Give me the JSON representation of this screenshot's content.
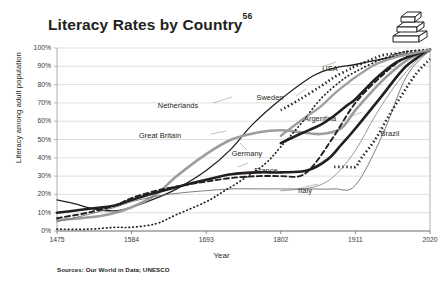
{
  "chart_data": {
    "type": "line",
    "title": "Literacy Rates by Country",
    "title_superscript": "56",
    "xlabel": "Year",
    "ylabel": "Literacy among adult population",
    "xlim": [
      1475,
      2020
    ],
    "ylim": [
      0,
      100
    ],
    "grid": true,
    "legend_position": "inline-labels",
    "source_note": "Sources: Our World in Data; UNESCO",
    "xticks": [
      "1475",
      "1584",
      "1693",
      "1802",
      "1911",
      "2020"
    ],
    "xtick_values": [
      1475,
      1584,
      1693,
      1802,
      1911,
      2020
    ],
    "yticks": [
      "0%",
      "10%",
      "20%",
      "30%",
      "40%",
      "50%",
      "60%",
      "70%",
      "80%",
      "90%",
      "100%"
    ],
    "ytick_values": [
      0,
      10,
      20,
      30,
      40,
      50,
      60,
      70,
      80,
      90,
      100
    ],
    "series": [
      {
        "name": "Netherlands",
        "style": "solid",
        "color": "#231f20",
        "width": 1.3,
        "x": [
          1475,
          1500,
          1530,
          1560,
          1584,
          1620,
          1650,
          1693,
          1730,
          1760,
          1802,
          1850,
          1880,
          1911,
          1950,
          1990,
          2020
        ],
        "values": [
          17,
          15,
          12,
          11,
          13,
          18,
          23,
          33,
          45,
          58,
          72,
          85,
          89,
          91,
          94,
          97,
          99
        ]
      },
      {
        "name": "Great Britain",
        "style": "solid",
        "color": "#9d9d9d",
        "width": 2.6,
        "x": [
          1475,
          1510,
          1550,
          1584,
          1620,
          1650,
          1693,
          1730,
          1770,
          1802,
          1830,
          1860,
          1890,
          1911,
          1950,
          1985,
          2020
        ],
        "values": [
          6,
          7,
          9,
          13,
          20,
          30,
          42,
          50,
          54,
          55,
          54,
          53,
          56,
          66,
          82,
          93,
          99
        ]
      },
      {
        "name": "Germany",
        "style": "solid",
        "color": "#231f20",
        "width": 2.6,
        "x": [
          1475,
          1520,
          1560,
          1584,
          1620,
          1660,
          1693,
          1730,
          1770,
          1802,
          1840,
          1870,
          1890,
          1911,
          1950,
          1985,
          2020
        ],
        "values": [
          10,
          12,
          14,
          17,
          21,
          25,
          28,
          31,
          32,
          32,
          33,
          39,
          47,
          56,
          74,
          90,
          99
        ]
      },
      {
        "name": "France",
        "style": "dashed",
        "color": "#231f20",
        "width": 1.9,
        "x": [
          1475,
          1520,
          1560,
          1584,
          1620,
          1660,
          1693,
          1730,
          1770,
          1802,
          1830,
          1850,
          1880,
          1911,
          1950,
          1985,
          2020
        ],
        "values": [
          7,
          10,
          14,
          18,
          22,
          25,
          27,
          29,
          30,
          30,
          30,
          36,
          52,
          70,
          85,
          95,
          99
        ]
      },
      {
        "name": "Italy",
        "style": "solid",
        "color": "#6e6e6e",
        "width": 0.9,
        "x": [
          1475,
          1520,
          1560,
          1584,
          1620,
          1660,
          1693,
          1730,
          1770,
          1802,
          1840,
          1880,
          1911,
          1950,
          1985,
          2020
        ],
        "values": [
          5,
          9,
          13,
          16,
          19,
          21,
          22,
          23,
          23,
          23,
          23,
          23,
          25,
          52,
          84,
          99
        ]
      },
      {
        "name": "Sweden",
        "style": "dotted-fine",
        "color": "#231f20",
        "width": 1.7,
        "x": [
          1475,
          1520,
          1560,
          1584,
          1620,
          1650,
          1693,
          1720,
          1750,
          1780,
          1802,
          1830,
          1860,
          1890,
          1911,
          1950,
          1985,
          2020
        ],
        "values": [
          1,
          1,
          2,
          2,
          4,
          9,
          16,
          22,
          29,
          37,
          46,
          58,
          72,
          82,
          87,
          94,
          98,
          99
        ]
      },
      {
        "name": "USA",
        "style": "dotted-coarse",
        "color": "#231f20",
        "width": 2.6,
        "x": [
          1802,
          1830,
          1860,
          1880,
          1900,
          1911,
          1930,
          1950,
          1970,
          1990,
          2020
        ],
        "values": [
          66,
          72,
          79,
          84,
          88,
          90,
          93,
          96,
          97,
          98,
          99
        ]
      },
      {
        "name": "Argentina",
        "style": "solid",
        "color": "#231f20",
        "width": 2.6,
        "x": [
          1802,
          1830,
          1860,
          1880,
          1900,
          1911,
          1940,
          1970,
          1995,
          2020
        ],
        "values": [
          48,
          53,
          58,
          63,
          69,
          72,
          83,
          92,
          96,
          99
        ]
      },
      {
        "name": "Argentina-grey",
        "style": "solid",
        "color": "#9d9d9d",
        "width": 2.3,
        "x": [
          1802,
          1830,
          1860,
          1880,
          1900,
          1911,
          1940,
          1970,
          1995,
          2020
        ],
        "values": [
          52,
          60,
          68,
          75,
          81,
          84,
          91,
          95,
          97,
          99
        ]
      },
      {
        "name": "Brazil",
        "style": "dotted-coarse",
        "color": "#231f20",
        "width": 2.6,
        "x": [
          1880,
          1900,
          1911,
          1920,
          1940,
          1960,
          1980,
          2000,
          2020
        ],
        "values": [
          35,
          35,
          35,
          40,
          50,
          63,
          75,
          86,
          94
        ]
      },
      {
        "name": "Brazil-thin",
        "style": "solid",
        "color": "#8c8c8c",
        "width": 0.9,
        "x": [
          1802,
          1850,
          1880,
          1911,
          1940,
          1970,
          2000,
          2020
        ],
        "values": [
          22,
          24,
          30,
          44,
          63,
          80,
          93,
          99
        ]
      }
    ],
    "inline_labels": [
      {
        "name": "Netherlands",
        "x_px": 178,
        "y_px": 105
      },
      {
        "name": "Great Britain",
        "x_px": 160,
        "y_px": 135
      },
      {
        "name": "Germany",
        "x_px": 247,
        "y_px": 153
      },
      {
        "name": "France",
        "x_px": 266,
        "y_px": 170
      },
      {
        "name": "Italy",
        "x_px": 305,
        "y_px": 190
      },
      {
        "name": "Sweden",
        "x_px": 270,
        "y_px": 97
      },
      {
        "name": "USA",
        "x_px": 330,
        "y_px": 68
      },
      {
        "name": "Argentina",
        "x_px": 320,
        "y_px": 118
      },
      {
        "name": "Brazil",
        "x_px": 390,
        "y_px": 133
      }
    ]
  },
  "icon": {
    "books": "stacked-books-icon"
  }
}
